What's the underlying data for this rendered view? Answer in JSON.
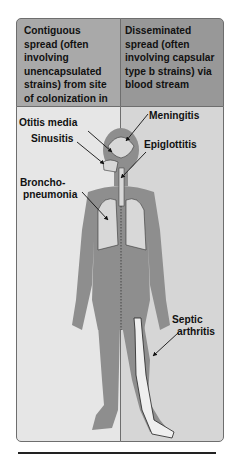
{
  "headers": {
    "left": "Contiguous spread (often involving unencapsulated strains) from site of colonization in the respiratory tract",
    "right": "Disseminated spread (often involving capsular type b strains) via blood stream"
  },
  "labels": {
    "otitis_media": "Otitis media",
    "sinusitis": "Sinusitis",
    "bronchopneumonia_1": "Broncho-",
    "bronchopneumonia_2": "pneumonia",
    "meningitis": "Meningitis",
    "epiglottitis": "Epiglottitis",
    "septic_1": "Septic",
    "septic_2": "arthritis"
  },
  "colors": {
    "header_left": "#a9a9a9",
    "header_right": "#989898",
    "panel_left": "#e6e6e6",
    "panel_right": "#d6d6d6",
    "body": "#8e8e8e"
  }
}
